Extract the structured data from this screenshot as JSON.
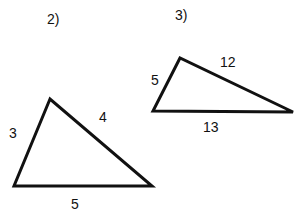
{
  "problems": [
    {
      "number": "2)",
      "sides": {
        "left": "3",
        "right": "4",
        "bottom": "5"
      },
      "vertices": [
        [
          50,
          99
        ],
        [
          14,
          186
        ],
        [
          152,
          186
        ]
      ]
    },
    {
      "number": "3)",
      "sides": {
        "left": "5",
        "right": "12",
        "bottom": "13"
      },
      "vertices": [
        [
          180,
          58
        ],
        [
          153,
          111
        ],
        [
          293,
          112
        ]
      ]
    }
  ],
  "colors": {
    "stroke": "#111111",
    "background": "#ffffff"
  }
}
